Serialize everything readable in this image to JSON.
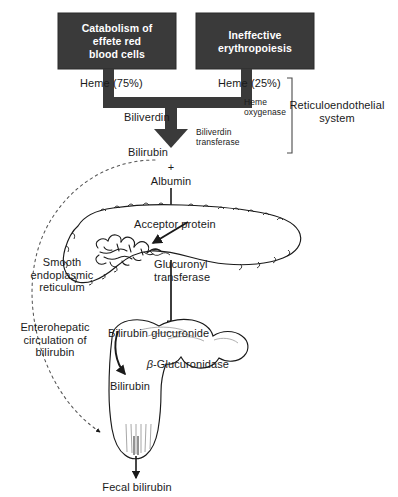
{
  "figure": {
    "type": "biochemical-pathway-diagram",
    "colors": {
      "box_fill": "#3a3a3a",
      "box_text": "#ffffff",
      "stroke": "#1a1a1a",
      "thick_arrow": "#3a3a3a",
      "background": "#ffffff",
      "dashed": "#666666"
    }
  },
  "sources": {
    "left_box": "Catabolism of\neffete red\nblood cells",
    "right_box": "Ineffective\nerythropoiesis",
    "left_yield": "Heme (75%)",
    "right_yield": "Heme (25%)"
  },
  "enzymes": {
    "heme_oxygenase": "Heme\noxygenase",
    "biliverdin_transferase": "Biliverdin\ntransferase",
    "glucuronyl_transferase": "Glucuronyl\ntransferase",
    "beta_glucuronidase_prefix": "β",
    "beta_glucuronidase_suffix": "-Glucuronidase"
  },
  "metabolites": {
    "biliverdin": "Biliverdin",
    "bilirubin": "Bilirubin",
    "plus": "+",
    "albumin": "Albumin",
    "acceptor_protein": "Acceptor protein",
    "bilirubin_glucuronide": "Bilirubin glucuronide",
    "bilirubin_gut": "Bilirubin",
    "fecal_bilirubin": "Fecal bilirubin"
  },
  "annotations": {
    "reticuloendothelial_system": "Reticuloendothelial\nsystem",
    "smooth_er": "Smooth\nendoplasmic\nreticulum",
    "enterohepatic": "Enterohepatic\ncirculation of\nbilirubin"
  }
}
